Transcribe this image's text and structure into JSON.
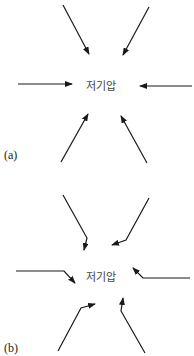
{
  "panels": [
    {
      "id": "a",
      "tag": "(a)",
      "center_label": "저기압",
      "description": "Winds converge straight toward low pressure center",
      "arrows": [
        {
          "name": "top-left",
          "points": [
            [
              63,
              5
            ],
            [
              89,
              54
            ]
          ]
        },
        {
          "name": "top-right",
          "points": [
            [
              149,
              7
            ],
            [
              123,
              55
            ]
          ]
        },
        {
          "name": "left",
          "points": [
            [
              18,
              84
            ],
            [
              72,
              84
            ]
          ]
        },
        {
          "name": "right",
          "points": [
            [
              192,
              86
            ],
            [
              140,
              86
            ]
          ]
        },
        {
          "name": "bottom-left",
          "points": [
            [
              61,
              162
            ],
            [
              88,
              114
            ]
          ]
        },
        {
          "name": "bottom-right",
          "points": [
            [
              147,
              163
            ],
            [
              121,
              116
            ]
          ]
        }
      ]
    },
    {
      "id": "b",
      "tag": "(b)",
      "center_label": "저기압",
      "description": "Winds converge toward low pressure center and deflect near it",
      "arrows": [
        {
          "name": "top-left",
          "points": [
            [
              63,
              195
            ],
            [
              87,
              238
            ],
            [
              84,
              250
            ]
          ]
        },
        {
          "name": "top-right",
          "points": [
            [
              149,
              198
            ],
            [
              126,
              240
            ],
            [
              112,
              245
            ]
          ]
        },
        {
          "name": "left",
          "points": [
            [
              16,
              271
            ],
            [
              64,
              271
            ],
            [
              75,
              283
            ]
          ]
        },
        {
          "name": "right",
          "points": [
            [
              190,
              278
            ],
            [
              143,
              278
            ],
            [
              133,
              268
            ]
          ]
        },
        {
          "name": "bottom-left",
          "points": [
            [
              58,
              351
            ],
            [
              81,
              308
            ],
            [
              95,
              304
            ]
          ]
        },
        {
          "name": "bottom-right",
          "points": [
            [
              145,
              353
            ],
            [
              121,
              311
            ],
            [
              123,
              298
            ]
          ]
        }
      ]
    }
  ],
  "colors": {
    "arrow": "#1a1a1a",
    "label": "#444444"
  }
}
